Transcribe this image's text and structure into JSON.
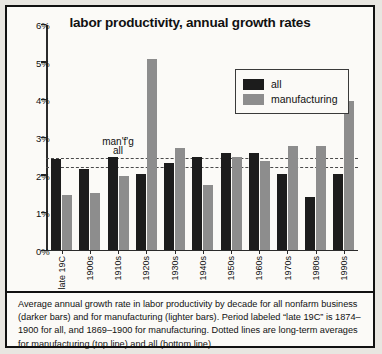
{
  "chart_data": {
    "type": "bar",
    "title": "labor productivity, annual growth rates",
    "xlabel": "",
    "ylabel": "",
    "ylim": [
      0,
      6
    ],
    "ytick_values": [
      0,
      1,
      2,
      3,
      4,
      5,
      6
    ],
    "ytick_labels": [
      "0%",
      "1%",
      "2%",
      "3%",
      "4%",
      "5%",
      "6%"
    ],
    "grid": false,
    "legend_position": "upper-right-inside",
    "categories": [
      "late 19C",
      "1900s",
      "1910s",
      "1920s",
      "1930s",
      "1940s",
      "1950s",
      "1960s",
      "1970s",
      "1980s",
      "1990s"
    ],
    "series": [
      {
        "name": "all",
        "color": "#1c1c1c",
        "values": [
          2.4,
          2.15,
          2.45,
          2.0,
          2.3,
          2.45,
          2.55,
          2.55,
          2.0,
          1.4,
          2.0
        ]
      },
      {
        "name": "manufacturing",
        "color": "#8d8d8d",
        "values": [
          1.45,
          1.5,
          1.95,
          5.05,
          2.7,
          1.7,
          2.45,
          2.35,
          2.75,
          2.75,
          3.95
        ]
      }
    ],
    "reference_lines": [
      {
        "label": "man'f'g",
        "value": 2.45,
        "style": "dotted"
      },
      {
        "label": "all",
        "value": 2.2,
        "style": "dotted"
      }
    ],
    "annotations": []
  },
  "legend": {
    "items": [
      {
        "label": "all",
        "color": "#1c1c1c"
      },
      {
        "label": "manufacturing",
        "color": "#8d8d8d"
      }
    ]
  },
  "caption": {
    "text": "Average annual growth rate in labor productivity by decade for all nonfarm business (darker bars) and for manufacturing (lighter bars). Period labeled “late 19C” is 1874–1900 for all, and 1869–1900 for manufacturing. Dotted lines are long-term averages for manufacturing (top line) and all (bottom line)."
  }
}
